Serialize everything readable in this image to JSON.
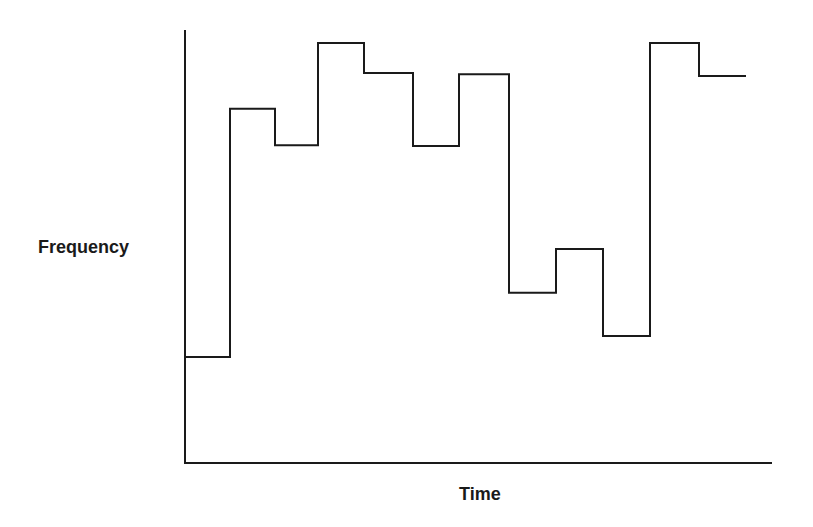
{
  "chart_data": {
    "type": "line",
    "subtype": "step",
    "title": "",
    "xlabel": "Time",
    "ylabel": "Frequency",
    "x_ticks": [],
    "y_ticks": [],
    "grid": false,
    "legend": null,
    "ylim": [
      0,
      100
    ],
    "note": "No axis ticks shown; values are relative heights (0 = x-axis, 100 = top of y-axis).",
    "x": [
      0,
      1,
      2,
      3,
      4,
      5,
      6,
      7,
      8,
      9,
      10,
      11
    ],
    "series": [
      {
        "name": "Frequency",
        "values": [
          24.5,
          81.8,
          73.4,
          97.0,
          90.1,
          73.2,
          89.8,
          39.3,
          49.4,
          29.3,
          97.0,
          89.4
        ]
      }
    ],
    "colors": {
      "line": "#1a1a1a",
      "axis": "#1a1a1a",
      "background": "#ffffff"
    }
  },
  "labels": {
    "x_axis": "Time",
    "y_axis": "Frequency"
  }
}
